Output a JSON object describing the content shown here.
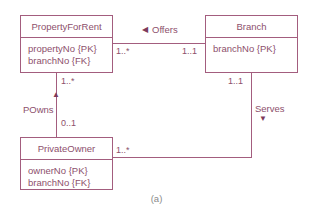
{
  "figure": {
    "caption": "(a)",
    "colors": {
      "entity_border": "#a35d7e",
      "entity_text": "#8d4f6c",
      "line": "#a35d7e",
      "caption_text": "#8a8a8a",
      "background": "#ffffff"
    }
  },
  "entities": [
    {
      "id": "property-for-rent",
      "name": "PropertyForRent",
      "attributes": [
        "propertyNo {PK}",
        "branchNo {FK}"
      ]
    },
    {
      "id": "branch",
      "name": "Branch",
      "attributes": [
        "branchNo {PK}"
      ]
    },
    {
      "id": "private-owner",
      "name": "PrivateOwner",
      "attributes": [
        "ownerNo {PK}",
        "branchNo {FK}"
      ]
    }
  ],
  "associations": [
    {
      "id": "offers",
      "label": "Offers",
      "direction_glyph": "◀",
      "from_entity": "PropertyForRent",
      "to_entity": "Branch",
      "multiplicity_from": "1..*",
      "multiplicity_to": "1..1"
    },
    {
      "id": "powns",
      "label": "POwns",
      "direction_glyph": "▲",
      "from_entity": "PropertyForRent",
      "to_entity": "PrivateOwner",
      "multiplicity_from": "1..*",
      "multiplicity_to": "0..1"
    },
    {
      "id": "serves",
      "label": "Serves",
      "direction_glyph": "▼",
      "from_entity": "Branch",
      "to_entity": "PrivateOwner",
      "multiplicity_from": "1..1",
      "multiplicity_to": "1..*"
    }
  ]
}
